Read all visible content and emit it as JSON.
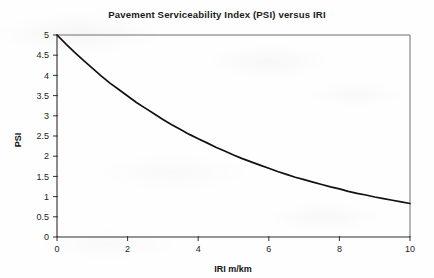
{
  "chart_data": {
    "type": "line",
    "title": "Pavement Serviceability Index (PSI) versus IRI",
    "xlabel": "IRI m/km",
    "ylabel": "PSI",
    "xlim": [
      0,
      10
    ],
    "ylim": [
      0,
      5
    ],
    "grid": false,
    "legend": null,
    "xticks": [
      0,
      2,
      4,
      6,
      8,
      10
    ],
    "xtick_labels": [
      "0",
      "2",
      "4",
      "6",
      "8",
      "10"
    ],
    "yticks": [
      0,
      0.5,
      1,
      1.5,
      2,
      2.5,
      3,
      3.5,
      4,
      4.5,
      5
    ],
    "ytick_labels": [
      "0",
      "0.5",
      "1",
      "1.5",
      "2",
      "2.5",
      "3",
      "3.5",
      "4",
      "4.5",
      "5"
    ],
    "series": [
      {
        "name": "PSI",
        "color": "#111111",
        "equation": "PSI = 5 * exp(-0.18 * IRI)",
        "x": [
          0,
          0.25,
          0.5,
          0.75,
          1,
          1.25,
          1.5,
          1.75,
          2,
          2.25,
          2.5,
          2.75,
          3,
          3.25,
          3.5,
          3.75,
          4,
          4.25,
          4.5,
          4.75,
          5,
          5.25,
          5.5,
          5.75,
          6,
          6.25,
          6.5,
          6.75,
          7,
          7.25,
          7.5,
          7.75,
          8,
          8.25,
          8.5,
          8.75,
          9,
          9.25,
          9.5,
          9.75,
          10
        ],
        "y": [
          5.0,
          4.78,
          4.57,
          4.37,
          4.18,
          3.99,
          3.81,
          3.65,
          3.49,
          3.33,
          3.19,
          3.05,
          2.91,
          2.78,
          2.66,
          2.54,
          2.43,
          2.33,
          2.22,
          2.13,
          2.03,
          1.94,
          1.86,
          1.78,
          1.7,
          1.62,
          1.55,
          1.48,
          1.42,
          1.36,
          1.3,
          1.24,
          1.19,
          1.13,
          1.08,
          1.04,
          0.99,
          0.95,
          0.91,
          0.87,
          0.83
        ]
      }
    ]
  },
  "chart": {
    "title": "Pavement Serviceability Index (PSI) versus IRI",
    "x_axis_title": "IRI m/km",
    "y_axis_title": "PSI"
  },
  "colors": {
    "curve": "#111111",
    "axis": "#3a3a3a",
    "border": "#6e6e6e",
    "text": "#1d1d1d",
    "background": "#fefefe"
  }
}
